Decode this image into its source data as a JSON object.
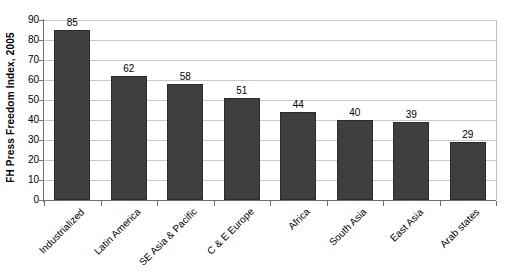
{
  "chart_data": {
    "type": "bar",
    "title": "",
    "xlabel": "",
    "ylabel": "FH Press Freedom Index, 2005",
    "ylim": [
      0,
      90
    ],
    "ytick_step": 10,
    "yticks": [
      90,
      80,
      70,
      60,
      50,
      40,
      30,
      20,
      10,
      0
    ],
    "grid": true,
    "legend": "none",
    "orientation": "vertical",
    "categories": [
      "Industrialized",
      "Latin America",
      "SE Asia & Pacific",
      "C & E Europe",
      "Africa",
      "South Asia",
      "East Asia",
      "Arab states"
    ],
    "values": [
      85,
      62,
      58,
      51,
      44,
      40,
      39,
      29
    ],
    "data_labels": [
      "85",
      "62",
      "58",
      "51",
      "44",
      "40",
      "39",
      "29"
    ],
    "colors": {
      "bar_fill": "#3f3f3f",
      "bar_border": "#2b2b2b",
      "gridline": "#c8c8c8",
      "axis_line": "#6e6e6e",
      "plot_border": "#c0c0c0",
      "background": "#ffffff",
      "text": "#000000"
    }
  }
}
